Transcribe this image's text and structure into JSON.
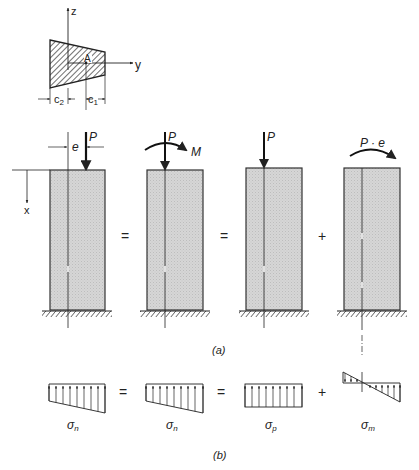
{
  "figure": {
    "cross_section": {
      "axis_z": "z",
      "axis_y": "y",
      "point": "A",
      "dim_left": "c",
      "dim_left_sub": "2",
      "dim_right": "c",
      "dim_right_sub": "1"
    },
    "columns": [
      {
        "id": "eccentric",
        "load_label": "P",
        "eccentricity_label": "e",
        "axis_label": "x"
      },
      {
        "id": "load-and-moment",
        "load_label": "P",
        "moment_label": "M"
      },
      {
        "id": "axial",
        "load_label": "P"
      },
      {
        "id": "bending",
        "moment_label": "P · e"
      }
    ],
    "operators_row_a": [
      "=",
      "=",
      "+"
    ],
    "part_a_label": "(a)",
    "stress_diagrams": [
      {
        "id": "sigma-n-1",
        "symbol": "σ",
        "subscript": "n",
        "shape": "trapezoid"
      },
      {
        "id": "sigma-n-2",
        "symbol": "σ",
        "subscript": "n",
        "shape": "trapezoid"
      },
      {
        "id": "sigma-p",
        "symbol": "σ",
        "subscript": "p",
        "shape": "uniform"
      },
      {
        "id": "sigma-m",
        "symbol": "σ",
        "subscript": "m",
        "shape": "linear-bending"
      }
    ],
    "operators_row_b": [
      "=",
      "=",
      "+"
    ],
    "part_b_label": "(b)",
    "colors": {
      "line": "#222222",
      "column_fill": "#d4d4d4",
      "background": "#ffffff"
    }
  }
}
